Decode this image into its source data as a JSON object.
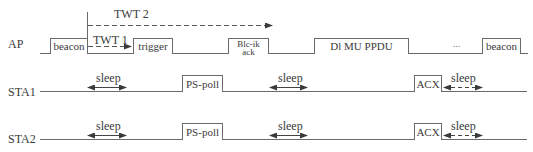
{
  "rows": [
    {
      "id": "ap",
      "label": "AP"
    },
    {
      "id": "sta1",
      "label": "STA1"
    },
    {
      "id": "sta2",
      "label": "STA2"
    }
  ],
  "ap": {
    "frames": [
      {
        "label": "beacon"
      },
      {
        "label": "trigger"
      },
      {
        "label_line1": "Blc-ik",
        "label_line2": "ack"
      },
      {
        "label": "Dl MU PPDU"
      },
      {
        "label": "beacon"
      }
    ],
    "ellipsis": "...",
    "twt1": "TWT 1",
    "twt2": "TWT 2"
  },
  "sta1": {
    "frames": [
      {
        "label": "PS-poll"
      },
      {
        "label": "ACX"
      }
    ],
    "sleep_labels": [
      "sleep",
      "sleep",
      "sleep"
    ]
  },
  "sta2": {
    "frames": [
      {
        "label": "PS-poll"
      },
      {
        "label": "ACX"
      }
    ],
    "sleep_labels": [
      "sleep",
      "sleep",
      "sleep"
    ]
  },
  "colors": {
    "line": "#6a6a6a",
    "text": "#3a3a3a",
    "background": "#ffffff"
  }
}
